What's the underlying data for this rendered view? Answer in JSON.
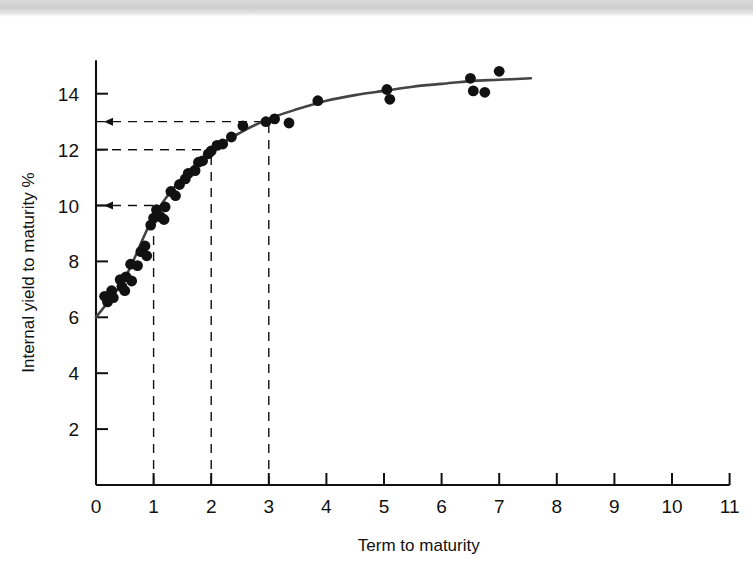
{
  "figure": {
    "background_color": "#ffffff",
    "scan_band_color": "#d4d4d4",
    "ink_color": "#111111",
    "curve_color": "#444444",
    "point_color": "#111111"
  },
  "chart_data": {
    "type": "scatter",
    "title": "",
    "subtitle": "",
    "xlabel": "Term to maturity",
    "ylabel": "Internal yield to maturity %",
    "xlim": [
      0,
      11
    ],
    "ylim": [
      0,
      15.2
    ],
    "xticks": [
      0,
      1,
      2,
      3,
      4,
      5,
      6,
      7,
      8,
      9,
      10,
      11
    ],
    "xtick_labels": [
      "0",
      "1",
      "2",
      "3",
      "4",
      "5",
      "6",
      "7",
      "8",
      "9",
      "10",
      "11"
    ],
    "yticks": [
      2,
      4,
      6,
      8,
      10,
      12,
      14
    ],
    "ytick_labels": [
      "2",
      "4",
      "6",
      "8",
      "10",
      "12",
      "14"
    ],
    "grid": false,
    "legend": null,
    "legend_position": "none",
    "series": [
      {
        "name": "Bond observations",
        "marker": "filled-circle",
        "points": [
          [
            0.15,
            6.75
          ],
          [
            0.2,
            6.55
          ],
          [
            0.27,
            6.95
          ],
          [
            0.3,
            6.7
          ],
          [
            0.42,
            7.35
          ],
          [
            0.45,
            7.1
          ],
          [
            0.5,
            6.95
          ],
          [
            0.52,
            7.45
          ],
          [
            0.6,
            7.9
          ],
          [
            0.62,
            7.3
          ],
          [
            0.72,
            7.85
          ],
          [
            0.78,
            8.35
          ],
          [
            0.85,
            8.55
          ],
          [
            0.88,
            8.2
          ],
          [
            0.95,
            9.3
          ],
          [
            1.0,
            9.55
          ],
          [
            1.05,
            9.85
          ],
          [
            1.12,
            9.6
          ],
          [
            1.18,
            9.5
          ],
          [
            1.2,
            9.95
          ],
          [
            1.3,
            10.5
          ],
          [
            1.38,
            10.35
          ],
          [
            1.45,
            10.75
          ],
          [
            1.55,
            10.95
          ],
          [
            1.6,
            11.15
          ],
          [
            1.72,
            11.25
          ],
          [
            1.78,
            11.55
          ],
          [
            1.85,
            11.6
          ],
          [
            1.95,
            11.85
          ],
          [
            2.0,
            11.95
          ],
          [
            2.1,
            12.15
          ],
          [
            2.2,
            12.2
          ],
          [
            2.35,
            12.45
          ],
          [
            2.55,
            12.85
          ],
          [
            2.95,
            13.0
          ],
          [
            3.1,
            13.1
          ],
          [
            3.35,
            12.95
          ],
          [
            3.85,
            13.75
          ],
          [
            5.05,
            14.15
          ],
          [
            5.1,
            13.8
          ],
          [
            6.5,
            14.55
          ],
          [
            6.55,
            14.1
          ],
          [
            6.75,
            14.05
          ],
          [
            7.0,
            14.8
          ]
        ]
      }
    ],
    "fitted_curve": {
      "name": "Fitted yield curve",
      "x_start": 0.0,
      "x_end": 7.55,
      "y_start": 6.0,
      "y_end": 14.55,
      "control_points": [
        [
          0.0,
          6.0
        ],
        [
          0.5,
          7.4
        ],
        [
          1.0,
          9.6
        ],
        [
          1.5,
          11.0
        ],
        [
          2.0,
          11.95
        ],
        [
          2.5,
          12.6
        ],
        [
          3.0,
          13.1
        ],
        [
          3.5,
          13.45
        ],
        [
          4.0,
          13.75
        ],
        [
          4.5,
          13.95
        ],
        [
          5.0,
          14.1
        ],
        [
          5.5,
          14.25
        ],
        [
          6.0,
          14.35
        ],
        [
          6.5,
          14.45
        ],
        [
          7.0,
          14.5
        ],
        [
          7.55,
          14.55
        ]
      ]
    },
    "reference_lines": [
      {
        "id": "ref-13",
        "yield": 13.0,
        "term": 3.0,
        "arrow": "left",
        "style": "dashed"
      },
      {
        "id": "ref-12",
        "yield": 12.0,
        "term": 2.0,
        "arrow": "none",
        "style": "dashed"
      },
      {
        "id": "ref-10",
        "yield": 10.0,
        "term": 1.0,
        "arrow": "left",
        "style": "dashed"
      }
    ]
  }
}
